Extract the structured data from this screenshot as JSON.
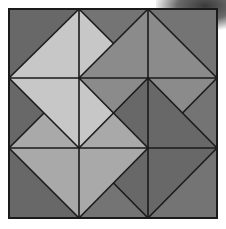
{
  "figure": {
    "title": "Square dissected into triangles (3x3 grid with diagonals)",
    "grid": {
      "rows": 3,
      "cols": 3,
      "x_px": [
        9,
        79,
        148,
        217
      ],
      "y_px": [
        9,
        78,
        148,
        218
      ]
    },
    "colors": {
      "line": "#1a1a1a",
      "dark": "#686868",
      "dark2": "#747474",
      "medium": "#8b8b8b",
      "medlight": "#a9a9a9",
      "light": "#c7c7c7"
    },
    "pieces": [
      {
        "pts": [
          [
            0,
            0
          ],
          [
            1,
            0
          ],
          [
            0,
            1
          ]
        ],
        "shade": "dark"
      },
      {
        "pts": [
          [
            1,
            0
          ],
          [
            0,
            1
          ],
          [
            1,
            1
          ]
        ],
        "shade": "light"
      },
      {
        "pts": [
          [
            1,
            0
          ],
          [
            1.5,
            0.5
          ],
          [
            1,
            1
          ]
        ],
        "shade": "light"
      },
      {
        "pts": [
          [
            1,
            0
          ],
          [
            2,
            0
          ],
          [
            1.5,
            0.5
          ]
        ],
        "shade": "dark2"
      },
      {
        "pts": [
          [
            2,
            0
          ],
          [
            1,
            1
          ],
          [
            2,
            1
          ]
        ],
        "shade": "medium"
      },
      {
        "pts": [
          [
            2,
            0
          ],
          [
            3,
            0
          ],
          [
            3,
            1
          ]
        ],
        "shade": "dark2"
      },
      {
        "pts": [
          [
            2,
            0
          ],
          [
            3,
            1
          ],
          [
            2,
            1
          ]
        ],
        "shade": "medium"
      },
      {
        "pts": [
          [
            0,
            1
          ],
          [
            1,
            1
          ],
          [
            1,
            2
          ]
        ],
        "shade": "light"
      },
      {
        "pts": [
          [
            0,
            1
          ],
          [
            0.5,
            1.5
          ],
          [
            0,
            2
          ]
        ],
        "shade": "dark"
      },
      {
        "pts": [
          [
            0.5,
            1.5
          ],
          [
            1,
            2
          ],
          [
            0,
            2
          ]
        ],
        "shade": "medlight"
      },
      {
        "pts": [
          [
            1,
            1
          ],
          [
            1.5,
            1.5
          ],
          [
            1,
            2
          ]
        ],
        "shade": "light"
      },
      {
        "pts": [
          [
            1,
            1
          ],
          [
            2,
            1
          ],
          [
            1.5,
            1.5
          ]
        ],
        "shade": "medium"
      },
      {
        "pts": [
          [
            2,
            1
          ],
          [
            2,
            2
          ],
          [
            1.5,
            1.5
          ]
        ],
        "shade": "dark"
      },
      {
        "pts": [
          [
            1.5,
            1.5
          ],
          [
            2,
            2
          ],
          [
            1,
            2
          ]
        ],
        "shade": "medlight"
      },
      {
        "pts": [
          [
            2,
            1
          ],
          [
            3,
            1
          ],
          [
            2.5,
            1.5
          ]
        ],
        "shade": "medium"
      },
      {
        "pts": [
          [
            3,
            1
          ],
          [
            3,
            2
          ],
          [
            2.5,
            1.5
          ]
        ],
        "shade": "dark2"
      },
      {
        "pts": [
          [
            2,
            1
          ],
          [
            2.5,
            1.5
          ],
          [
            3,
            2
          ],
          [
            2,
            2
          ]
        ],
        "shade": "dark"
      },
      {
        "pts": [
          [
            0,
            2
          ],
          [
            1,
            2
          ],
          [
            1,
            3
          ]
        ],
        "shade": "medlight"
      },
      {
        "pts": [
          [
            0,
            2
          ],
          [
            1,
            3
          ],
          [
            0,
            3
          ]
        ],
        "shade": "dark"
      },
      {
        "pts": [
          [
            1,
            2
          ],
          [
            2,
            2
          ],
          [
            1,
            3
          ]
        ],
        "shade": "medlight"
      },
      {
        "pts": [
          [
            2,
            2
          ],
          [
            2,
            3
          ],
          [
            1.5,
            2.5
          ]
        ],
        "shade": "dark"
      },
      {
        "pts": [
          [
            1.5,
            2.5
          ],
          [
            2,
            3
          ],
          [
            1,
            3
          ]
        ],
        "shade": "dark2"
      },
      {
        "pts": [
          [
            2,
            2
          ],
          [
            3,
            2
          ],
          [
            2,
            3
          ]
        ],
        "shade": "dark"
      },
      {
        "pts": [
          [
            3,
            2
          ],
          [
            3,
            3
          ],
          [
            2,
            3
          ]
        ],
        "shade": "dark2"
      }
    ],
    "lines": [
      [
        [
          1,
          0
        ],
        [
          1,
          3
        ]
      ],
      [
        [
          2,
          0
        ],
        [
          2,
          3
        ]
      ],
      [
        [
          0,
          1
        ],
        [
          3,
          1
        ]
      ],
      [
        [
          0,
          2
        ],
        [
          3,
          2
        ]
      ],
      [
        [
          1,
          0
        ],
        [
          0,
          1
        ]
      ],
      [
        [
          1,
          0
        ],
        [
          1.5,
          0.5
        ]
      ],
      [
        [
          2,
          0
        ],
        [
          1,
          1
        ]
      ],
      [
        [
          2,
          0
        ],
        [
          3,
          1
        ]
      ],
      [
        [
          3,
          1
        ],
        [
          2.5,
          1.5
        ]
      ],
      [
        [
          2,
          1
        ],
        [
          3,
          2
        ]
      ],
      [
        [
          2,
          1
        ],
        [
          1,
          2
        ]
      ],
      [
        [
          1,
          1
        ],
        [
          2,
          2
        ]
      ],
      [
        [
          0,
          1
        ],
        [
          1,
          2
        ]
      ],
      [
        [
          0.5,
          1.5
        ],
        [
          0,
          2
        ]
      ],
      [
        [
          0,
          2
        ],
        [
          1,
          3
        ]
      ],
      [
        [
          1,
          3
        ],
        [
          2,
          2
        ]
      ],
      [
        [
          1.5,
          2.5
        ],
        [
          2,
          3
        ]
      ],
      [
        [
          2,
          3
        ],
        [
          3,
          2
        ]
      ]
    ]
  }
}
